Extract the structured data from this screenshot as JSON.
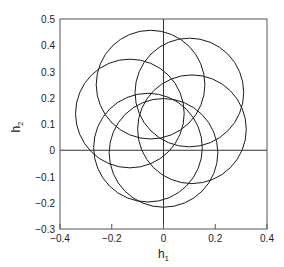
{
  "chart_data": {
    "type": "line",
    "title": "",
    "xlabel": "h",
    "xlabel_sub": "1",
    "ylabel": "h",
    "ylabel_sub": "2",
    "xlim": [
      -0.4,
      0.4
    ],
    "ylim": [
      -0.3,
      0.5
    ],
    "x_ticks": [
      -0.4,
      -0.2,
      0,
      0.2,
      0.4
    ],
    "x_tick_labels": [
      "-0.4",
      "-0.2",
      "0",
      "0.2",
      "0.4"
    ],
    "y_ticks": [
      -0.3,
      -0.2,
      -0.1,
      0,
      0.1,
      0.2,
      0.3,
      0.4,
      0.5
    ],
    "y_tick_labels": [
      "-0.3",
      "-0.2",
      "-0.1",
      "0",
      "0.1",
      "0.2",
      "0.3",
      "0.4",
      "0.5"
    ],
    "zero_lines": true,
    "grid": false,
    "series": [
      {
        "name": "circle-1",
        "center": [
          -0.05,
          0.25
        ],
        "radius": 0.21
      },
      {
        "name": "circle-2",
        "center": [
          0.1,
          0.22
        ],
        "radius": 0.21
      },
      {
        "name": "circle-3",
        "center": [
          -0.13,
          0.14
        ],
        "radius": 0.21
      },
      {
        "name": "circle-4",
        "center": [
          0.11,
          0.08
        ],
        "radius": 0.21
      },
      {
        "name": "circle-5",
        "center": [
          -0.06,
          0.01
        ],
        "radius": 0.21
      },
      {
        "name": "circle-6",
        "center": [
          0.0,
          -0.01
        ],
        "radius": 0.21
      }
    ]
  }
}
